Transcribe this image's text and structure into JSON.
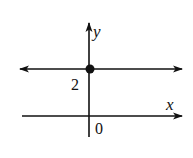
{
  "diagram": {
    "type": "coordinate-graph",
    "axes": {
      "x_label": "x",
      "y_label": "y",
      "origin_label": "0"
    },
    "line": {
      "equation": "y = 2",
      "y_intercept_label": "2",
      "arrows": "both"
    },
    "point": {
      "x": 0,
      "y": 2,
      "filled": true
    },
    "colors": {
      "ink": "#111111",
      "background": "#ffffff"
    }
  }
}
